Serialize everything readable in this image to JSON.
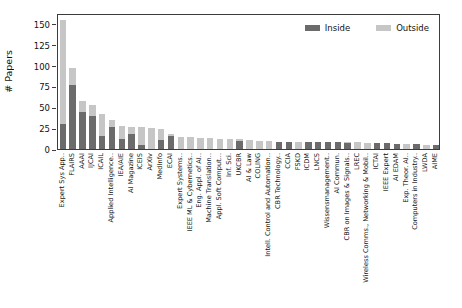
{
  "chart_data": {
    "type": "bar",
    "stacked": true,
    "title": "",
    "xlabel": "",
    "ylabel": "# Papers",
    "ylim": [
      0,
      163
    ],
    "yticks": [
      0,
      25,
      50,
      75,
      100,
      125,
      150
    ],
    "grid": false,
    "legend": {
      "position": "upper right",
      "entries": [
        {
          "name": "Inside",
          "color": "#6b6b6b"
        },
        {
          "name": "Outside",
          "color": "#c6c6c6"
        }
      ]
    },
    "categories": [
      "Expert Sys App..",
      "FLAIRS",
      "AAAI",
      "IJCAI",
      "ICAIL",
      "Applied Intelligence..",
      "IEA/AIE",
      "AI Magazine",
      "ICEIS",
      "ArXiv",
      "MedInfo",
      "ECAI",
      "Expert Systems..",
      "IEEE ML & Cybernetics..",
      "Eng. Appl. of AI..",
      "Machine Translation..",
      "Appl. Soft Comput...",
      "Inf. Sci.",
      "UKCBR",
      "AI & Law",
      "COLING",
      "Intell. Control and Automation..",
      "CBR Technology..",
      "CCIA",
      "FSKD",
      "ICDM",
      "LNCS",
      "Wissensmanagement..",
      "AI Commun.",
      "CBR on Images & Signals..",
      "LREC",
      "Wireless Comms., Networking & Mobil..",
      "ICTAI",
      "IEEE Expert",
      "AI EDAM",
      "Exp. Theor. AI..",
      "Computers in Industry..",
      "LWDA",
      "AIME"
    ],
    "series": [
      {
        "name": "Inside",
        "color": "#6b6b6b",
        "values": [
          30,
          77,
          44,
          40,
          16,
          26,
          12,
          18,
          5,
          0,
          11,
          16,
          0,
          0,
          0,
          0,
          0,
          0,
          10,
          0,
          0,
          0,
          9,
          9,
          0,
          8,
          8,
          8,
          8,
          7,
          0,
          0,
          7,
          7,
          6,
          0,
          6,
          0,
          5
        ]
      },
      {
        "name": "Outside",
        "color": "#c6c6c6",
        "values": [
          125,
          20,
          14,
          13,
          26,
          9,
          16,
          8,
          21,
          25,
          13,
          2,
          14,
          14,
          13,
          13,
          12,
          12,
          2,
          11,
          10,
          10,
          0,
          0,
          9,
          0,
          0,
          0,
          0,
          1,
          8,
          7,
          0,
          0,
          0,
          6,
          0,
          5,
          0
        ]
      }
    ]
  }
}
